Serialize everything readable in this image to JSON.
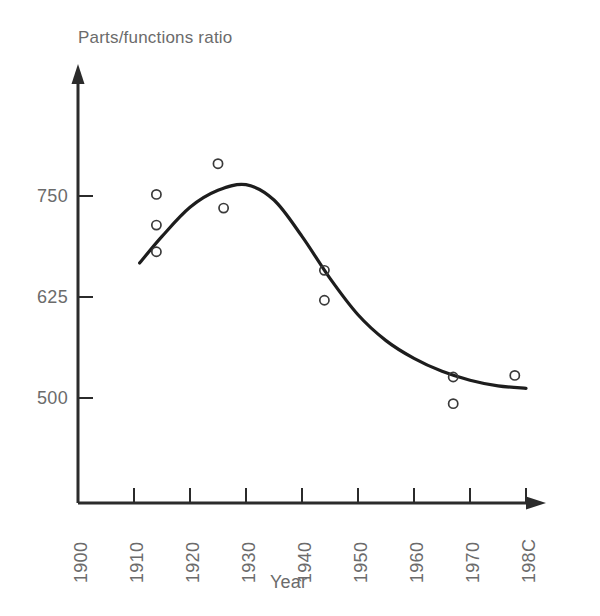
{
  "chart_data": {
    "type": "scatter",
    "title": "",
    "ylabel": "Parts/functions ratio",
    "xlabel": "Year",
    "grid": false,
    "legend": null,
    "xlim": [
      1900,
      1980
    ],
    "ylim": [
      420,
      840
    ],
    "xticks": [
      1900,
      1910,
      1920,
      1930,
      1940,
      1950,
      1960,
      1970,
      1980
    ],
    "xtick_labels": [
      "1900",
      "1910",
      "1920",
      "1930",
      "1940",
      "1950",
      "1960",
      "1970",
      "198C"
    ],
    "yticks": [
      500,
      625,
      750
    ],
    "ytick_labels": [
      "500",
      "625",
      "750"
    ],
    "series": [
      {
        "name": "observations",
        "type": "scatter",
        "marker": "open-circle",
        "points": [
          {
            "x": 1914,
            "y": 752
          },
          {
            "x": 1914,
            "y": 714
          },
          {
            "x": 1914,
            "y": 681
          },
          {
            "x": 1925,
            "y": 790
          },
          {
            "x": 1926,
            "y": 735
          },
          {
            "x": 1944,
            "y": 658
          },
          {
            "x": 1944,
            "y": 621
          },
          {
            "x": 1967,
            "y": 526
          },
          {
            "x": 1967,
            "y": 493
          },
          {
            "x": 1978,
            "y": 528
          }
        ]
      },
      {
        "name": "fitted-curve",
        "type": "line",
        "points": [
          {
            "x": 1911,
            "y": 667
          },
          {
            "x": 1915,
            "y": 700
          },
          {
            "x": 1920,
            "y": 736
          },
          {
            "x": 1925,
            "y": 757
          },
          {
            "x": 1930,
            "y": 764
          },
          {
            "x": 1935,
            "y": 745
          },
          {
            "x": 1940,
            "y": 700
          },
          {
            "x": 1945,
            "y": 648
          },
          {
            "x": 1950,
            "y": 603
          },
          {
            "x": 1955,
            "y": 571
          },
          {
            "x": 1960,
            "y": 549
          },
          {
            "x": 1965,
            "y": 533
          },
          {
            "x": 1970,
            "y": 522
          },
          {
            "x": 1975,
            "y": 515
          },
          {
            "x": 1980,
            "y": 512
          }
        ]
      }
    ],
    "colors": {
      "axis": "#2b2b2b",
      "curve": "#1d1d1d",
      "marker_stroke": "#3a3a3a",
      "text": "#6b6b6b",
      "background": "#ffffff"
    }
  }
}
